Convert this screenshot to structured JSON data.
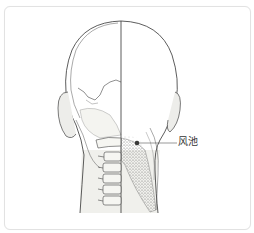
{
  "figure": {
    "point_label": "风池",
    "point_color": "#3a3a3a",
    "line_color": "#555555",
    "border_color": "#e2e2e2"
  }
}
